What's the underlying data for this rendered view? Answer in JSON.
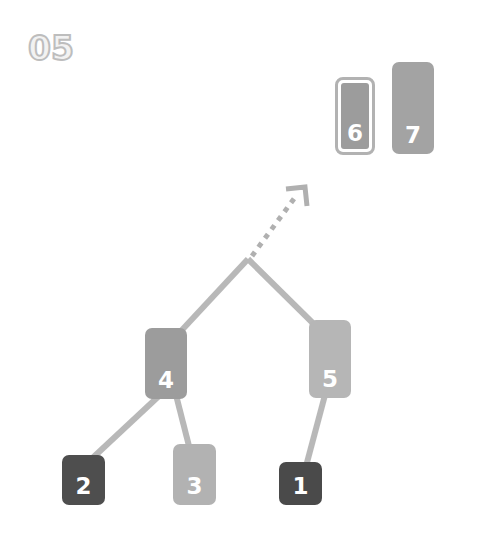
{
  "step_label": "05",
  "colors": {
    "edge": "#b8b8b8",
    "arrow": "#b0b0b0",
    "node_dark": "#4e4e4e",
    "node_mid": "#9c9c9c",
    "node_light": "#b6b6b6"
  },
  "sorted": [
    {
      "id": "node-6",
      "label": "6",
      "highlighted": true
    },
    {
      "id": "node-7",
      "label": "7"
    }
  ],
  "tree": {
    "root_junction": "apex",
    "nodes": [
      {
        "id": "node-4",
        "label": "4"
      },
      {
        "id": "node-5",
        "label": "5"
      },
      {
        "id": "node-2",
        "label": "2"
      },
      {
        "id": "node-3",
        "label": "3"
      },
      {
        "id": "node-1",
        "label": "1"
      }
    ],
    "edges": [
      [
        "apex",
        "node-4"
      ],
      [
        "apex",
        "node-5"
      ],
      [
        "node-4",
        "node-2"
      ],
      [
        "node-4",
        "node-3"
      ],
      [
        "node-5",
        "node-1"
      ]
    ],
    "arrow": "apex → sorted area (dashed)"
  }
}
